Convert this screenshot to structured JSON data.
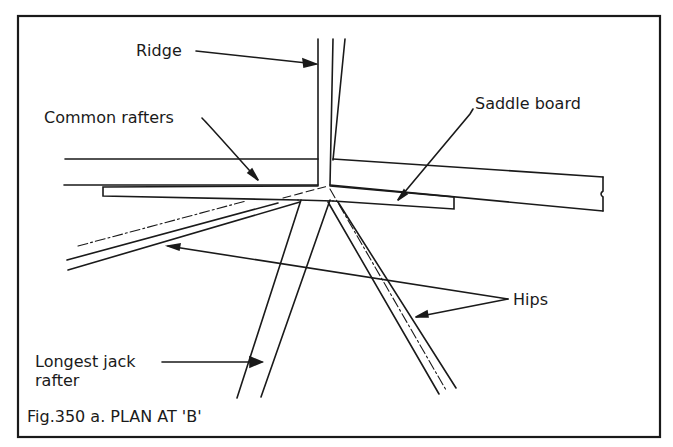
{
  "figure": {
    "caption": "Fig.350 a. PLAN AT 'B'",
    "labels": {
      "ridge": "Ridge",
      "common_rafters": "Common rafters",
      "saddle_board": "Saddle board",
      "hips": "Hips",
      "longest_jack_line1": "Longest jack",
      "longest_jack_line2": "rafter"
    }
  },
  "colors": {
    "ink": "#1a1a1a",
    "background": "#ffffff"
  }
}
